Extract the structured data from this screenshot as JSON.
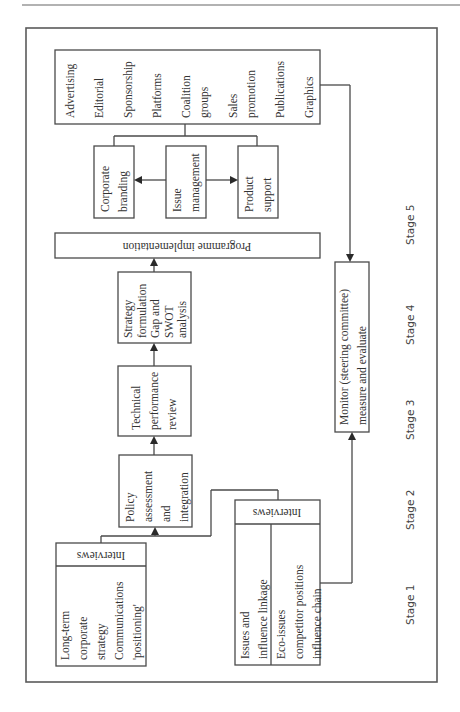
{
  "diagram": {
    "media_box": {
      "items": [
        [
          "Advertising"
        ],
        [
          "Editorial"
        ],
        [
          "Sponsorship"
        ],
        [
          "Platforms"
        ],
        [
          "Coalition",
          "groups"
        ],
        [
          "Sales",
          "promotion"
        ],
        [
          "Publications"
        ],
        [
          "Graphics"
        ]
      ]
    },
    "corporate_branding": [
      "Corporate",
      "branding"
    ],
    "issue_management": [
      "Issue",
      "management"
    ],
    "product_support": [
      "Product",
      "support"
    ],
    "programme_implementation": "Programme implementation",
    "strategy_formulation": [
      "Strategy",
      "formulation",
      "Gap and",
      "SWOT",
      "analysis"
    ],
    "technical_review": [
      "Technical",
      "performance",
      "review"
    ],
    "policy_assessment": [
      "Policy",
      "assessment",
      "and",
      "integration"
    ],
    "interviews_left": {
      "header": "Interviews",
      "lines": [
        "Long-term",
        "corporate",
        "strategy",
        "Communications",
        "'positioning'"
      ]
    },
    "interviews_right": {
      "header": "Interviews",
      "col1": [
        "Issues and",
        "influence linkage"
      ],
      "col2": [
        "Eco-issues",
        "competitor positions",
        "influence chain"
      ]
    },
    "monitor": [
      "Monitor (steering committee)",
      "measure and evaluate"
    ],
    "stages": [
      "Stage 1",
      "Stage 2",
      "Stage 3",
      "Stage 4",
      "Stage 5"
    ]
  }
}
